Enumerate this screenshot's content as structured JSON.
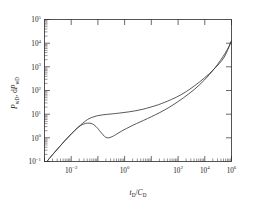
{
  "figure": {
    "background_color": "#ffffff",
    "curve_color": "#3a3a3a",
    "axis_color": "#2b2b2b"
  },
  "chart_data": {
    "type": "line",
    "title": "",
    "subtitle": "",
    "xlabel": "t_D/C_D",
    "ylabel": "P_wD, dP_wD",
    "xscale": "log",
    "yscale": "log",
    "xlim": [
      0.001,
      1000000
    ],
    "ylim": [
      0.1,
      100000
    ],
    "grid": false,
    "legend": null,
    "xticks": [
      0.01,
      1,
      100,
      10000,
      1000000
    ],
    "xtick_labels": [
      "10^-2",
      "10^0",
      "10^2",
      "10^4",
      "10^6"
    ],
    "yticks": [
      0.1,
      1,
      10,
      100,
      1000,
      10000,
      100000
    ],
    "ytick_labels": [
      "10^-1",
      "10^0",
      "10^1",
      "10^2",
      "10^3",
      "10^4",
      "10^5"
    ],
    "minor_ticks": true,
    "series": [
      {
        "name": "P_wD (dimensionless pressure)",
        "x": [
          0.0013,
          0.0025,
          0.005,
          0.01,
          0.02,
          0.04,
          0.07,
          0.12,
          0.2,
          0.35,
          0.6,
          1.0,
          1.8,
          3.0,
          6.0,
          12,
          25,
          55,
          120,
          300,
          800,
          2200,
          6000,
          17000,
          50000,
          150000,
          450000,
          1000000
        ],
        "y": [
          0.1,
          0.2,
          0.4,
          0.79,
          1.5,
          2.7,
          4.2,
          6.0,
          7.4,
          8.6,
          9.3,
          9.8,
          10.3,
          10.8,
          11.6,
          12.6,
          14.0,
          16.2,
          19.5,
          25.0,
          35.0,
          52.0,
          85.0,
          160.0,
          340.0,
          830.0,
          2600.0,
          13000.0
        ]
      },
      {
        "name": "dP_wD (pressure derivative)",
        "x": [
          0.0013,
          0.0025,
          0.005,
          0.01,
          0.02,
          0.04,
          0.07,
          0.12,
          0.2,
          0.3,
          0.45,
          0.65,
          0.9,
          1.2,
          1.8,
          3.0,
          5.0,
          9.0,
          18,
          40,
          90,
          220,
          600,
          1700,
          5000,
          16000,
          50000,
          160000,
          500000,
          1000000
        ],
        "y": [
          0.1,
          0.2,
          0.4,
          0.79,
          1.5,
          2.7,
          3.7,
          4.2,
          3.9,
          3.0,
          2.0,
          1.35,
          1.05,
          1.0,
          1.12,
          1.45,
          1.9,
          2.5,
          3.4,
          4.7,
          6.5,
          9.5,
          15.0,
          26.0,
          50.0,
          110.0,
          280.0,
          900.0,
          3800.0,
          12000.0
        ]
      }
    ],
    "annotations": [
      {
        "text": "unit-slope wellbore storage line at early time",
        "visible": false
      }
    ]
  },
  "axes": {
    "x_title_main": "t",
    "x_title_sub": "D",
    "x_title_slash": "/",
    "x_title_main2": "C",
    "x_title_sub2": "D",
    "y_title_p1": "P",
    "y_title_s1": "wD",
    "y_title_sep": ", d",
    "y_title_p2": "P",
    "y_title_s2": "wD"
  }
}
